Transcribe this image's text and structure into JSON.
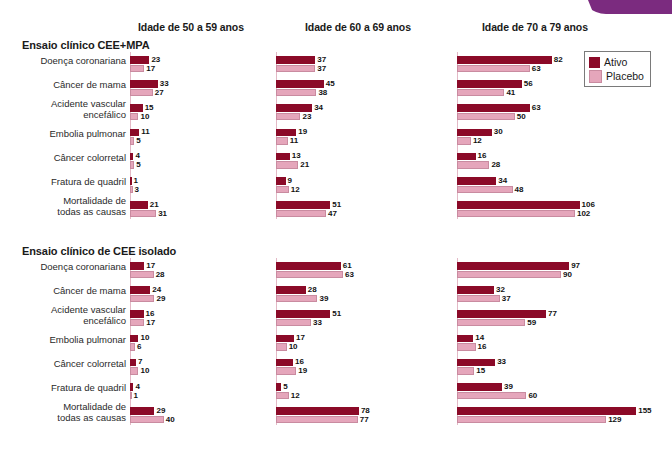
{
  "decoration": {
    "corner_tab_color": "#7B2B7F"
  },
  "colors": {
    "active": "#8B0A28",
    "placebo": "#E5A6BB",
    "axis": "#e3b9c6"
  },
  "legend": {
    "items": [
      {
        "label": "Ativo",
        "color": "#8B0A28"
      },
      {
        "label": "Placebo",
        "color": "#E5A6BB"
      }
    ]
  },
  "column_headers": [
    "Idade de 50 a 59 anos",
    "Idade de 60 a 69 anos",
    "Idade de 70 a 79 anos"
  ],
  "sections": [
    {
      "title": "Ensaio clínico CEE+MPA"
    },
    {
      "title": "Ensaio clínico de CEE isolado"
    }
  ],
  "row_labels": [
    "Doença coronariana",
    "Câncer de mama",
    "Acidente vascular\nencefálico",
    "Embolia pulmonar",
    "Câncer colorretal",
    "Fratura de quadril",
    "Mortalidade de\ntodas as causas"
  ],
  "chart_data": {
    "type": "bar",
    "orientation": "horizontal",
    "title": "",
    "xlabel": "",
    "ylabel": "",
    "grid": false,
    "legend_position": "top-right",
    "series_names": [
      "Ativo",
      "Placebo"
    ],
    "categories": [
      "Doença coronariana",
      "Câncer de mama",
      "Acidente vascular encefálico",
      "Embolia pulmonar",
      "Câncer colorretal",
      "Fratura de quadril",
      "Mortalidade de todas as causas"
    ],
    "panels": [
      {
        "section": "Ensaio clínico CEE+MPA",
        "age_group": "Idade de 50 a 59 anos",
        "xmax": 160,
        "series": [
          {
            "name": "Ativo",
            "values": [
              23,
              33,
              15,
              11,
              4,
              1,
              21
            ]
          },
          {
            "name": "Placebo",
            "values": [
              17,
              27,
              10,
              5,
              5,
              3,
              31
            ]
          }
        ]
      },
      {
        "section": "Ensaio clínico CEE+MPA",
        "age_group": "Idade de 60 a 69 anos",
        "xmax": 160,
        "series": [
          {
            "name": "Ativo",
            "values": [
              37,
              45,
              34,
              19,
              13,
              9,
              51
            ]
          },
          {
            "name": "Placebo",
            "values": [
              37,
              38,
              23,
              11,
              21,
              12,
              47
            ]
          }
        ]
      },
      {
        "section": "Ensaio clínico CEE+MPA",
        "age_group": "Idade de 70 a 79 anos",
        "xmax": 160,
        "series": [
          {
            "name": "Ativo",
            "values": [
              82,
              56,
              63,
              30,
              16,
              34,
              106
            ]
          },
          {
            "name": "Placebo",
            "values": [
              63,
              41,
              50,
              12,
              28,
              48,
              102
            ]
          }
        ]
      },
      {
        "section": "Ensaio clínico de CEE isolado",
        "age_group": "Idade de 50 a 59 anos",
        "xmax": 160,
        "series": [
          {
            "name": "Ativo",
            "values": [
              17,
              24,
              16,
              10,
              7,
              4,
              29
            ]
          },
          {
            "name": "Placebo",
            "values": [
              28,
              29,
              17,
              6,
              10,
              1,
              40
            ]
          }
        ]
      },
      {
        "section": "Ensaio clínico de CEE isolado",
        "age_group": "Idade de 60 a 69 anos",
        "xmax": 160,
        "series": [
          {
            "name": "Ativo",
            "values": [
              61,
              28,
              51,
              17,
              16,
              5,
              78
            ]
          },
          {
            "name": "Placebo",
            "values": [
              63,
              39,
              33,
              10,
              19,
              12,
              77
            ]
          }
        ]
      },
      {
        "section": "Ensaio clínico de CEE isolado",
        "age_group": "Idade de 70 a 79 anos",
        "xmax": 160,
        "series": [
          {
            "name": "Ativo",
            "values": [
              97,
              32,
              77,
              14,
              33,
              39,
              155
            ]
          },
          {
            "name": "Placebo",
            "values": [
              90,
              37,
              59,
              16,
              15,
              60,
              129
            ]
          }
        ]
      }
    ]
  }
}
